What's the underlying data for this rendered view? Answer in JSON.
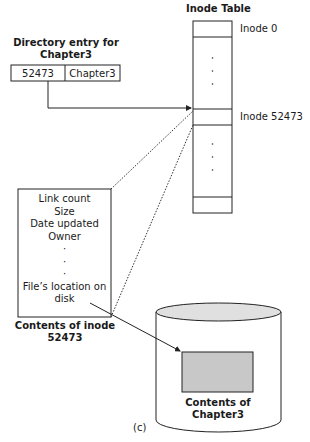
{
  "inode_table": {
    "title": "Inode Table",
    "labels": {
      "first": "Inode 0",
      "target": "Inode 52473"
    },
    "ellipsis": "·"
  },
  "directory_entry": {
    "caption_line1": "Directory entry for",
    "caption_line2": "Chapter3",
    "inode_number": "52473",
    "file_name": "Chapter3"
  },
  "inode_contents": {
    "fields": [
      "Link count",
      "Size",
      "Date updated",
      "Owner",
      "·",
      "·",
      "·",
      "File’s location on",
      "disk"
    ],
    "caption_line1": "Contents of inode",
    "caption_line2": "52473"
  },
  "disk": {
    "caption_line1": "Contents of",
    "caption_line2": "Chapter3",
    "block_color": "#c8c8c8",
    "top_color": "#e0e0e0"
  },
  "figure_label": "(c)"
}
